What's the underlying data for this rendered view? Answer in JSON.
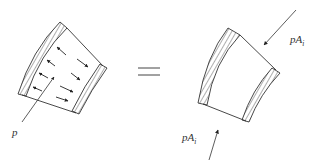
{
  "diagram": {
    "type": "free-body-equivalence",
    "equals_sign": "=",
    "left": {
      "description": "pipe-bend segment with internal pressure arrows",
      "label": "p"
    },
    "right": {
      "description": "pipe-bend segment with end pressure forces",
      "force_top": {
        "base": "pA",
        "sub": "i"
      },
      "force_bottom": {
        "base": "pA",
        "sub": "i"
      }
    },
    "colors": {
      "line": "#333333",
      "background": "#ffffff"
    }
  }
}
